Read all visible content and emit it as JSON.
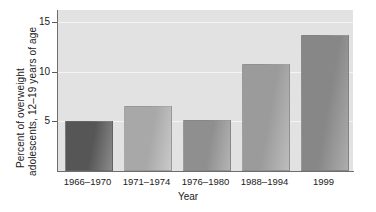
{
  "chart_data": {
    "type": "bar",
    "title": "",
    "subtitle": "",
    "xlabel": "Year",
    "ylabel": "Percent of overweight adolescents, 12–19 years of age",
    "ylabel_line1": "Percent of overweight",
    "ylabel_line2": "adolescents, 12–19 years of age",
    "categories": [
      "1966–1970",
      "1971–1974",
      "1976–1980",
      "1988–1994",
      "1999"
    ],
    "values": [
      5.0,
      6.5,
      5.1,
      10.8,
      13.7
    ],
    "ylim": [
      0,
      16.2
    ],
    "yticks": [
      5,
      10,
      15
    ],
    "ytick_labels": [
      "5",
      "10",
      "15"
    ],
    "grid": true,
    "legend": "none",
    "bar_colors": [
      "#565656",
      "#a8a8a8",
      "#8f8f8f",
      "#9b9b9b",
      "#878787"
    ],
    "bar_colors_light": [
      "#8a8a8a",
      "#c9c9c9",
      "#b4b4b4",
      "#bdbdbd",
      "#adadad"
    ],
    "plot_background": "#e2e2e2",
    "gridline_color": "#f4f4f4",
    "axis_color": "#6e6e6e",
    "text_color": "#1b1b1b"
  }
}
